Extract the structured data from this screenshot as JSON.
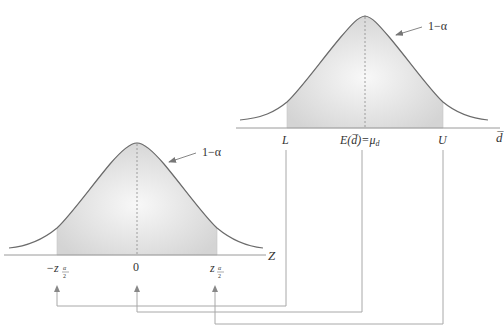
{
  "diagram": {
    "type": "normal-distribution-mapping",
    "top_curve": {
      "area_label": "1−α",
      "axis_label": "d̅",
      "ticks": {
        "lower": "L",
        "center_prefix": "E(",
        "center_var": "d̅",
        "center_suffix": ")=μ",
        "center_sub": "d",
        "upper": "U"
      }
    },
    "bottom_curve": {
      "area_label": "1−α",
      "axis_label": "Z",
      "ticks": {
        "lower_prefix": "−z",
        "lower_sub_num": "α",
        "lower_sub_den": "2",
        "center": "0",
        "upper_prefix": "z",
        "upper_sub_num": "α",
        "upper_sub_den": "2"
      }
    },
    "mappings": [
      {
        "from": "L",
        "to": "−zα/2"
      },
      {
        "from": "E(d̅)=μd",
        "to": "0"
      },
      {
        "from": "U",
        "to": "zα/2"
      }
    ],
    "colors": {
      "curve": "#6b6b6b",
      "fill_edge": "#d6d6d6",
      "fill_center": "#f7f7f7",
      "axis": "#9a9a9a",
      "connector": "#a8a8a8",
      "text": "#333333"
    }
  }
}
